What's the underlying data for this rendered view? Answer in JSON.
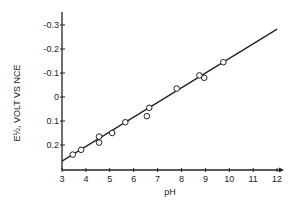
{
  "chart_data": {
    "type": "scatter",
    "title": "",
    "xlabel": "pH",
    "ylabel": "E½, VOLT VS NCE",
    "xlim": [
      3,
      12
    ],
    "ylim": [
      0.25,
      -0.35
    ],
    "y_inverted": true,
    "grid": false,
    "legend": null,
    "x_ticks": [
      "3",
      "4",
      "5",
      "6",
      "7",
      "8",
      "9",
      "10",
      "11",
      "12"
    ],
    "y_ticks": [
      "-0.3",
      "-0.2",
      "-0.1",
      "0",
      "0.1",
      "0.2"
    ],
    "series": [
      {
        "name": "measured",
        "marker": "open-circle",
        "points": [
          {
            "x": 3.45,
            "y": 0.24
          },
          {
            "x": 3.8,
            "y": 0.22
          },
          {
            "x": 4.55,
            "y": 0.165
          },
          {
            "x": 4.55,
            "y": 0.19
          },
          {
            "x": 5.1,
            "y": 0.15
          },
          {
            "x": 5.65,
            "y": 0.105
          },
          {
            "x": 6.55,
            "y": 0.08
          },
          {
            "x": 6.65,
            "y": 0.045
          },
          {
            "x": 7.8,
            "y": -0.035
          },
          {
            "x": 8.75,
            "y": -0.09
          },
          {
            "x": 8.95,
            "y": -0.08
          },
          {
            "x": 9.75,
            "y": -0.145
          }
        ]
      },
      {
        "name": "fit line",
        "type": "line",
        "points": [
          {
            "x": 3.0,
            "y": 0.267
          },
          {
            "x": 12.0,
            "y": -0.283
          }
        ]
      }
    ]
  }
}
